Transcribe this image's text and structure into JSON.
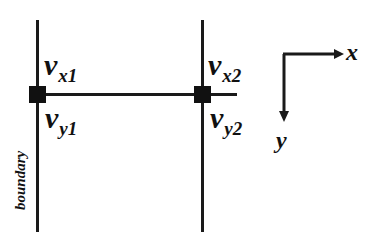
{
  "diagram": {
    "nodes": [
      {
        "id": "node1",
        "x_label": {
          "symbol": "v",
          "sub": "x1"
        },
        "y_label": {
          "symbol": "v",
          "sub": "y1"
        }
      },
      {
        "id": "node2",
        "x_label": {
          "symbol": "v",
          "sub": "x2"
        },
        "y_label": {
          "symbol": "v",
          "sub": "y2"
        }
      }
    ],
    "boundary_label": "boundary",
    "axes": {
      "x": "x",
      "y": "y"
    },
    "colors": {
      "line": "#1a1a1a",
      "node": "#111111",
      "background": "#ffffff"
    }
  }
}
